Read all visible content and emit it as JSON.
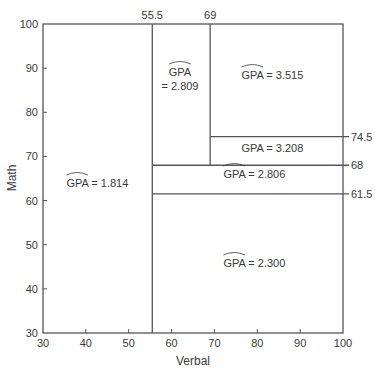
{
  "chart_data": {
    "type": "partition",
    "title": "",
    "xlabel": "Verbal",
    "ylabel": "Math",
    "xlim": [
      30,
      100
    ],
    "ylim": [
      30,
      100
    ],
    "x_ticks": [
      30,
      40,
      50,
      60,
      70,
      80,
      90,
      100
    ],
    "y_ticks": [
      30,
      40,
      50,
      60,
      70,
      80,
      90,
      100
    ],
    "grid": false,
    "split_annotations": {
      "top": [
        {
          "value": 55.5,
          "label": "55.5"
        },
        {
          "value": 69,
          "label": "69"
        }
      ],
      "right": [
        {
          "value": 74.5,
          "label": "74.5"
        },
        {
          "value": 68,
          "label": "68"
        },
        {
          "value": 61.5,
          "label": "61.5"
        }
      ]
    },
    "splits": [
      {
        "axis": "x",
        "at": 55.5,
        "from": 30,
        "to": 100
      },
      {
        "axis": "y",
        "at": 68,
        "x_from": 55.5,
        "x_to": 100
      },
      {
        "axis": "y",
        "at": 61.5,
        "x_from": 55.5,
        "x_to": 100
      },
      {
        "axis": "x",
        "at": 69,
        "from": 68,
        "to": 100
      },
      {
        "axis": "y",
        "at": 74.5,
        "x_from": 69,
        "x_to": 100
      }
    ],
    "regions": [
      {
        "verbal": [
          30,
          55.5
        ],
        "math": [
          30,
          100
        ],
        "gpa": 1.814,
        "hat": true,
        "label": "= 1.814",
        "label_lines": 1
      },
      {
        "verbal": [
          55.5,
          69
        ],
        "math": [
          68,
          100
        ],
        "gpa": 2.809,
        "hat": true,
        "label": "= 2.809",
        "label_lines": 2
      },
      {
        "verbal": [
          69,
          100
        ],
        "math": [
          74.5,
          100
        ],
        "gpa": 3.515,
        "hat": true,
        "label": "= 3.515",
        "label_lines": 1
      },
      {
        "verbal": [
          69,
          100
        ],
        "math": [
          68,
          74.5
        ],
        "gpa": 3.208,
        "hat": false,
        "label": "= 3.208",
        "label_lines": 1
      },
      {
        "verbal": [
          55.5,
          100
        ],
        "math": [
          61.5,
          68
        ],
        "gpa": 2.806,
        "hat": true,
        "label": "= 2.806",
        "label_lines": 1
      },
      {
        "verbal": [
          55.5,
          100
        ],
        "math": [
          30,
          61.5
        ],
        "gpa": 2.3,
        "hat": true,
        "label": "= 2.300",
        "label_lines": 1
      }
    ],
    "region_label_positions": [
      {
        "x": 100,
        "y": 187
      },
      {
        "x": 180,
        "y": 84
      },
      {
        "x": 275,
        "y": 79
      },
      {
        "x": 275,
        "y": 152
      },
      {
        "x": 257,
        "y": 178
      },
      {
        "x": 257,
        "y": 267
      }
    ]
  },
  "labels": {
    "variable": "GPA",
    "xlabel": "Verbal",
    "ylabel": "Math"
  }
}
